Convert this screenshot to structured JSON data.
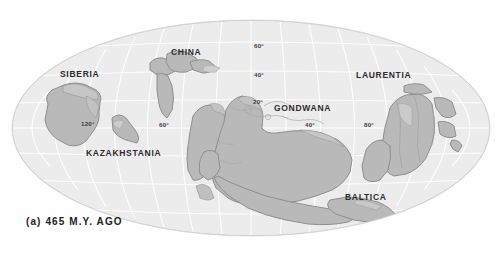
{
  "figure": {
    "caption": "(a)  465 M.Y. AGO",
    "type": "paleogeographic-map",
    "projection": "mollweide-oval"
  },
  "colors": {
    "background": "#fefefe",
    "ocean": "#ececec",
    "ocean_edge": "#d9d9d9",
    "land": "#b9b9b9",
    "land_outline": "#8e8e8e",
    "shelf": "#d2d2d2",
    "graticule": "#ffffff",
    "label_text": "#2b2b2b",
    "caption_text": "#222222"
  },
  "continents": [
    {
      "name": "SIBERIA",
      "label_x": 60,
      "label_y": 69
    },
    {
      "name": "CHINA",
      "label_x": 171,
      "label_y": 47
    },
    {
      "name": "KAZAKHSTANIA",
      "label_x": 86,
      "label_y": 148
    },
    {
      "name": "GONDWANA",
      "label_x": 274,
      "label_y": 103
    },
    {
      "name": "LAURENTIA",
      "label_x": 356,
      "label_y": 70
    },
    {
      "name": "BALTICA",
      "label_x": 345,
      "label_y": 192
    }
  ],
  "graticule_labels": [
    {
      "text": "60°",
      "kind": "latitude",
      "x": 254,
      "y": 42
    },
    {
      "text": "40°",
      "kind": "latitude",
      "x": 254,
      "y": 71
    },
    {
      "text": "20°",
      "kind": "latitude",
      "x": 253,
      "y": 98
    },
    {
      "text": "120°",
      "kind": "longitude",
      "x": 81,
      "y": 120
    },
    {
      "text": "60°",
      "kind": "longitude",
      "x": 159,
      "y": 121
    },
    {
      "text": "40°",
      "kind": "longitude",
      "x": 305,
      "y": 121
    },
    {
      "text": "80°",
      "kind": "longitude",
      "x": 364,
      "y": 121
    }
  ]
}
